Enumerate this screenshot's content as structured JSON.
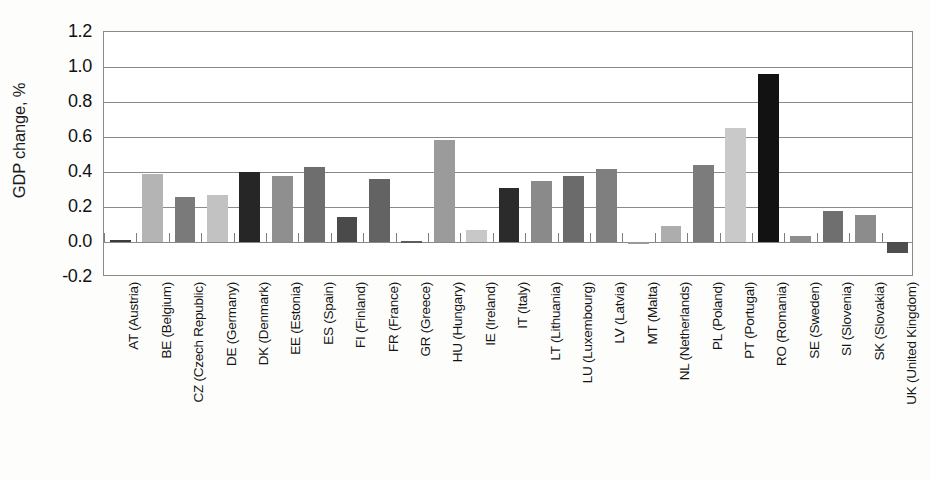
{
  "chart_data": {
    "type": "bar",
    "title": "",
    "xlabel": "",
    "ylabel": "GDP change, %",
    "ylim": [
      -0.2,
      1.2
    ],
    "yticks": [
      1.2,
      1.0,
      0.8,
      0.6,
      0.4,
      0.2,
      0.0,
      -0.2
    ],
    "ytick_labels": [
      "1.2",
      "1.0",
      "0.8",
      "0.6",
      "0.4",
      "0.2",
      "0.0",
      "-0.2"
    ],
    "grid": true,
    "legend": "none",
    "categories": [
      "AT (Austria)",
      "BE (Belgium)",
      "CZ (Czech Republic)",
      "DE (Germany)",
      "DK (Denmark)",
      "EE (Estonia)",
      "ES (Spain)",
      "FI (Finland)",
      "FR (France)",
      "GR (Greece)",
      "HU (Hungary)",
      "IE (Ireland)",
      "IT (Italy)",
      "LT (Lithuania)",
      "LU (Luxembourg)",
      "LV (Latvia)",
      "MT (Malta)",
      "NL (Netherlands)",
      "PL (Poland)",
      "PT (Portugal)",
      "RO (Romania)",
      "SE (Sweden)",
      "SI (Slovenia)",
      "SK (Slovakia)",
      "UK (United Kingdom)"
    ],
    "values": [
      0.01,
      0.39,
      0.26,
      0.27,
      0.4,
      0.375,
      0.43,
      0.145,
      0.36,
      0.005,
      0.585,
      0.07,
      0.31,
      0.35,
      0.375,
      0.415,
      0.0,
      0.09,
      0.44,
      0.65,
      0.96,
      0.035,
      0.175,
      0.155,
      -0.06
    ],
    "bar_colors": [
      "#3c3c3c",
      "#b4b4b4",
      "#7a7a7a",
      "#c2c2c2",
      "#262626",
      "#8f8f8f",
      "#6e6e6e",
      "#4a4a4a",
      "#636363",
      "#5c5c5c",
      "#9b9b9b",
      "#c8c8c8",
      "#2b2b2b",
      "#8a8a8a",
      "#6b6b6b",
      "#7f7f7f",
      "#9a9a9a",
      "#adadad",
      "#7c7c7c",
      "#c9c9c9",
      "#121212",
      "#8d8d8d",
      "#6f6f6f",
      "#8c8c8c",
      "#4e4e4e"
    ]
  }
}
